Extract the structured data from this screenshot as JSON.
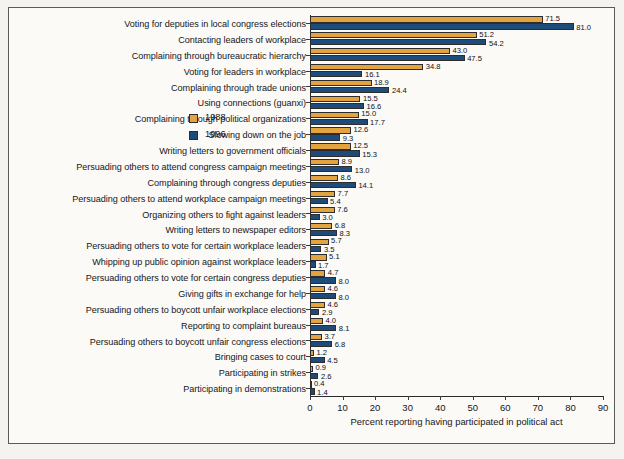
{
  "chart_data": {
    "type": "bar",
    "orientation": "horizontal",
    "title": "",
    "xlabel": "Percent reporting having participated in political act",
    "ylabel": "",
    "xlim": [
      0,
      90
    ],
    "xticks": [
      0,
      10,
      20,
      30,
      40,
      50,
      60,
      70,
      80,
      90
    ],
    "grid": false,
    "legend_position": "center-right",
    "legend": [
      "1988",
      "1996"
    ],
    "colors": {
      "1988": "#e3a33f",
      "1996": "#1d4b7a"
    },
    "categories": [
      "Voting for deputies in local congress elections",
      "Contacting leaders of workplace",
      "Complaining through bureaucratic hierarchy",
      "Voting for leaders in workplace",
      "Complaining through trade unions",
      "Using connections (guanxi)",
      "Complaining through political organizations",
      "Slowing down on the job",
      "Writing letters to government officials",
      "Persuading others to attend congress campaign meetings",
      "Complaining through congress deputies",
      "Persuading others to attend workplace campaign meetings",
      "Organizing others to fight against leaders",
      "Writing letters to newspaper editors",
      "Persuading others to vote for certain workplace leaders",
      "Whipping up public opinion against workplace leaders",
      "Persuading others to vote for certain congress deputies",
      "Giving gifts in exchange for help",
      "Persuading others to boycott unfair workplace elections",
      "Reporting to complaint bureaus",
      "Persuading others to boycott unfair congress elections",
      "Bringing cases to court",
      "Participating in strikes",
      "Participating in demonstrations"
    ],
    "series": [
      {
        "name": "1988",
        "color": "#e3a33f",
        "values": [
          71.5,
          51.2,
          43.0,
          34.8,
          18.9,
          15.5,
          15.0,
          12.6,
          12.5,
          8.9,
          8.6,
          7.7,
          7.6,
          6.8,
          5.7,
          5.1,
          4.7,
          4.6,
          4.6,
          4.0,
          3.7,
          1.2,
          0.9,
          0.4
        ],
        "labels": [
          "71.5",
          "51.2",
          "43.0",
          "34.8",
          "18.9",
          "15.5",
          "15.0",
          "12.6",
          "12.5",
          "8.9",
          "8.6",
          "7.7",
          "7.6",
          "6.8",
          "5.7",
          "5.1",
          "4.7",
          "4.6",
          "4.6",
          "4.0",
          "3.7",
          "1.2",
          "0.9",
          "0.4"
        ]
      },
      {
        "name": "1996",
        "color": "#1d4b7a",
        "values": [
          81.0,
          54.2,
          47.5,
          16.1,
          24.4,
          16.6,
          17.7,
          9.3,
          15.3,
          13.0,
          14.1,
          5.4,
          3.0,
          8.3,
          3.5,
          1.7,
          8.0,
          8.0,
          2.9,
          8.1,
          6.8,
          4.5,
          2.6,
          1.4
        ],
        "labels": [
          "81.0",
          "54.2",
          "47.5",
          "16.1",
          "24.4",
          "16.6",
          "17.7",
          "9.3",
          "15.3",
          "13.0",
          "14.1",
          "5.4",
          "3.0",
          "8.3",
          "3.5",
          "1.7",
          "8.0",
          "8.0",
          "2.9",
          "8.1",
          "6.8",
          "4.5",
          "2.6",
          "1.4"
        ]
      }
    ]
  }
}
